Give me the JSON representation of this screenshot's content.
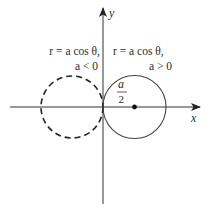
{
  "diagram": {
    "axes": {
      "x_label": "x",
      "y_label": "y"
    },
    "left_circle": {
      "equation": "r = a cos θ,",
      "condition": "a < 0",
      "style": "dashed"
    },
    "right_circle": {
      "equation": "r = a cos θ,",
      "condition": "a > 0",
      "style": "solid"
    },
    "radius_label": {
      "numerator": "a",
      "denominator": "2"
    },
    "colors": {
      "stroke": "#333333",
      "text": "#2a2a2a"
    }
  }
}
